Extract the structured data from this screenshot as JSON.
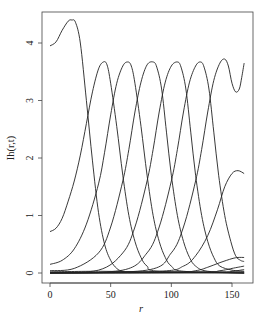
{
  "chart_data": {
    "type": "line",
    "title": "",
    "xlabel": "r",
    "ylabel": "Ih(r,t)",
    "xlim": [
      -4,
      166
    ],
    "ylim": [
      -0.18,
      4.5
    ],
    "xticks": [
      0,
      50,
      100,
      150
    ],
    "yticks": [
      0,
      1,
      2,
      3,
      4
    ],
    "grid": false,
    "legend": null,
    "line_color": "#222222",
    "x_range": [
      0,
      160
    ],
    "series": [
      {
        "name": "t1",
        "points": [
          [
            0,
            3.95
          ],
          [
            5,
            4.02
          ],
          [
            10,
            4.22
          ],
          [
            15,
            4.38
          ],
          [
            18,
            4.4
          ],
          [
            21,
            4.36
          ],
          [
            25,
            4.0
          ],
          [
            30,
            3.0
          ],
          [
            35,
            1.95
          ],
          [
            40,
            1.05
          ],
          [
            45,
            0.5
          ],
          [
            50,
            0.22
          ],
          [
            55,
            0.08
          ],
          [
            60,
            0.03
          ],
          [
            70,
            0.01
          ],
          [
            160,
            0.0
          ]
        ]
      },
      {
        "name": "t2",
        "points": [
          [
            0,
            0.72
          ],
          [
            5,
            0.78
          ],
          [
            10,
            0.95
          ],
          [
            15,
            1.25
          ],
          [
            20,
            1.6
          ],
          [
            25,
            2.05
          ],
          [
            30,
            2.6
          ],
          [
            35,
            3.15
          ],
          [
            40,
            3.55
          ],
          [
            44,
            3.67
          ],
          [
            47,
            3.62
          ],
          [
            50,
            3.3
          ],
          [
            55,
            2.55
          ],
          [
            60,
            1.7
          ],
          [
            65,
            1.0
          ],
          [
            70,
            0.55
          ],
          [
            75,
            0.27
          ],
          [
            80,
            0.12
          ],
          [
            90,
            0.03
          ],
          [
            160,
            0.0
          ]
        ]
      },
      {
        "name": "t3",
        "points": [
          [
            0,
            0.15
          ],
          [
            10,
            0.22
          ],
          [
            20,
            0.42
          ],
          [
            30,
            0.85
          ],
          [
            40,
            1.55
          ],
          [
            45,
            2.1
          ],
          [
            50,
            2.75
          ],
          [
            55,
            3.3
          ],
          [
            60,
            3.6
          ],
          [
            64,
            3.67
          ],
          [
            67,
            3.6
          ],
          [
            70,
            3.3
          ],
          [
            75,
            2.55
          ],
          [
            80,
            1.7
          ],
          [
            85,
            1.0
          ],
          [
            90,
            0.55
          ],
          [
            95,
            0.27
          ],
          [
            100,
            0.12
          ],
          [
            110,
            0.03
          ],
          [
            160,
            0.0
          ]
        ]
      },
      {
        "name": "t4",
        "points": [
          [
            0,
            0.04
          ],
          [
            20,
            0.08
          ],
          [
            40,
            0.35
          ],
          [
            50,
            0.8
          ],
          [
            60,
            1.6
          ],
          [
            65,
            2.15
          ],
          [
            70,
            2.8
          ],
          [
            75,
            3.32
          ],
          [
            80,
            3.62
          ],
          [
            85,
            3.67
          ],
          [
            88,
            3.58
          ],
          [
            92,
            3.2
          ],
          [
            96,
            2.45
          ],
          [
            100,
            1.7
          ],
          [
            105,
            1.0
          ],
          [
            110,
            0.55
          ],
          [
            115,
            0.27
          ],
          [
            120,
            0.12
          ],
          [
            130,
            0.03
          ],
          [
            160,
            0.0
          ]
        ]
      },
      {
        "name": "t5",
        "points": [
          [
            0,
            0.01
          ],
          [
            40,
            0.05
          ],
          [
            60,
            0.35
          ],
          [
            70,
            0.8
          ],
          [
            80,
            1.6
          ],
          [
            85,
            2.15
          ],
          [
            90,
            2.8
          ],
          [
            95,
            3.32
          ],
          [
            100,
            3.6
          ],
          [
            105,
            3.67
          ],
          [
            108,
            3.58
          ],
          [
            112,
            3.2
          ],
          [
            116,
            2.45
          ],
          [
            120,
            1.7
          ],
          [
            125,
            1.0
          ],
          [
            130,
            0.55
          ],
          [
            135,
            0.27
          ],
          [
            140,
            0.12
          ],
          [
            150,
            0.05
          ],
          [
            160,
            0.03
          ]
        ]
      },
      {
        "name": "t6",
        "points": [
          [
            0,
            0.0
          ],
          [
            60,
            0.05
          ],
          [
            80,
            0.35
          ],
          [
            90,
            0.8
          ],
          [
            100,
            1.6
          ],
          [
            105,
            2.15
          ],
          [
            110,
            2.8
          ],
          [
            115,
            3.32
          ],
          [
            120,
            3.6
          ],
          [
            124,
            3.67
          ],
          [
            127,
            3.58
          ],
          [
            131,
            3.2
          ],
          [
            135,
            2.45
          ],
          [
            139,
            1.7
          ],
          [
            144,
            1.0
          ],
          [
            149,
            0.55
          ],
          [
            153,
            0.3
          ],
          [
            157,
            0.22
          ],
          [
            160,
            0.2
          ]
        ]
      },
      {
        "name": "t7",
        "points": [
          [
            0,
            0.0
          ],
          [
            80,
            0.05
          ],
          [
            100,
            0.35
          ],
          [
            110,
            0.8
          ],
          [
            120,
            1.6
          ],
          [
            125,
            2.15
          ],
          [
            130,
            2.8
          ],
          [
            135,
            3.35
          ],
          [
            140,
            3.65
          ],
          [
            144,
            3.72
          ],
          [
            147,
            3.6
          ],
          [
            150,
            3.3
          ],
          [
            153,
            3.15
          ],
          [
            156,
            3.2
          ],
          [
            158,
            3.4
          ],
          [
            160,
            3.65
          ]
        ]
      },
      {
        "name": "t8",
        "points": [
          [
            0,
            0.0
          ],
          [
            90,
            0.03
          ],
          [
            110,
            0.12
          ],
          [
            120,
            0.3
          ],
          [
            130,
            0.65
          ],
          [
            138,
            1.1
          ],
          [
            144,
            1.5
          ],
          [
            150,
            1.73
          ],
          [
            155,
            1.78
          ],
          [
            160,
            1.73
          ]
        ]
      },
      {
        "name": "t9",
        "points": [
          [
            0,
            0.0
          ],
          [
            100,
            0.01
          ],
          [
            120,
            0.04
          ],
          [
            130,
            0.1
          ],
          [
            140,
            0.18
          ],
          [
            150,
            0.25
          ],
          [
            155,
            0.27
          ],
          [
            160,
            0.27
          ]
        ]
      },
      {
        "name": "t10",
        "points": [
          [
            0,
            0.0
          ],
          [
            120,
            0.01
          ],
          [
            140,
            0.04
          ],
          [
            150,
            0.08
          ],
          [
            160,
            0.12
          ]
        ]
      },
      {
        "name": "t11",
        "points": [
          [
            0,
            0.0
          ],
          [
            130,
            0.005
          ],
          [
            150,
            0.03
          ],
          [
            160,
            0.06
          ]
        ]
      },
      {
        "name": "t12",
        "points": [
          [
            0,
            0.02
          ],
          [
            40,
            0.03
          ],
          [
            80,
            0.02
          ],
          [
            120,
            0.02
          ],
          [
            160,
            0.02
          ]
        ]
      }
    ]
  },
  "axes": {
    "xlabel": "r",
    "ylabel": "Ih(r,t)",
    "xtick_labels": [
      "0",
      "50",
      "100",
      "150"
    ],
    "ytick_labels": [
      "0",
      "1",
      "2",
      "3",
      "4"
    ]
  }
}
